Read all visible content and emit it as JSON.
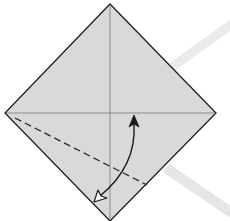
{
  "diagram": {
    "type": "origami-fold-step",
    "colors": {
      "background": "#ffffff",
      "paper_fill": "#d9d9d9",
      "outline": "#1f1f1f",
      "crease": "#7a7a7a",
      "fold_line": "#2a2a2a",
      "arrow": "#1a1a1a",
      "background_bands": "#ececec"
    },
    "paper": {
      "vertices": {
        "top": [
          110,
          4
        ],
        "right": [
          216,
          113
        ],
        "bottom": [
          110,
          221
        ],
        "left": [
          5,
          113
        ]
      }
    },
    "creases": [
      {
        "name": "vertical-center-crease",
        "from": [
          110,
          4
        ],
        "to": [
          110,
          221
        ]
      },
      {
        "name": "horizontal-center-crease",
        "from": [
          5,
          113
        ],
        "to": [
          216,
          113
        ]
      }
    ],
    "valley_fold": {
      "from": [
        15,
        118
      ],
      "to": [
        147,
        185
      ],
      "style": "dashed"
    },
    "fold_arrow": {
      "start": [
        134,
        118
      ],
      "end": [
        95,
        200
      ],
      "start_head": "filled",
      "end_head": "hollow",
      "meaning": "fold and unfold"
    },
    "background_bands": [
      {
        "from": [
          230,
          25
        ],
        "to": [
          172,
          66
        ]
      },
      {
        "from": [
          168,
          170
        ],
        "to": [
          230,
          212
        ]
      }
    ]
  }
}
